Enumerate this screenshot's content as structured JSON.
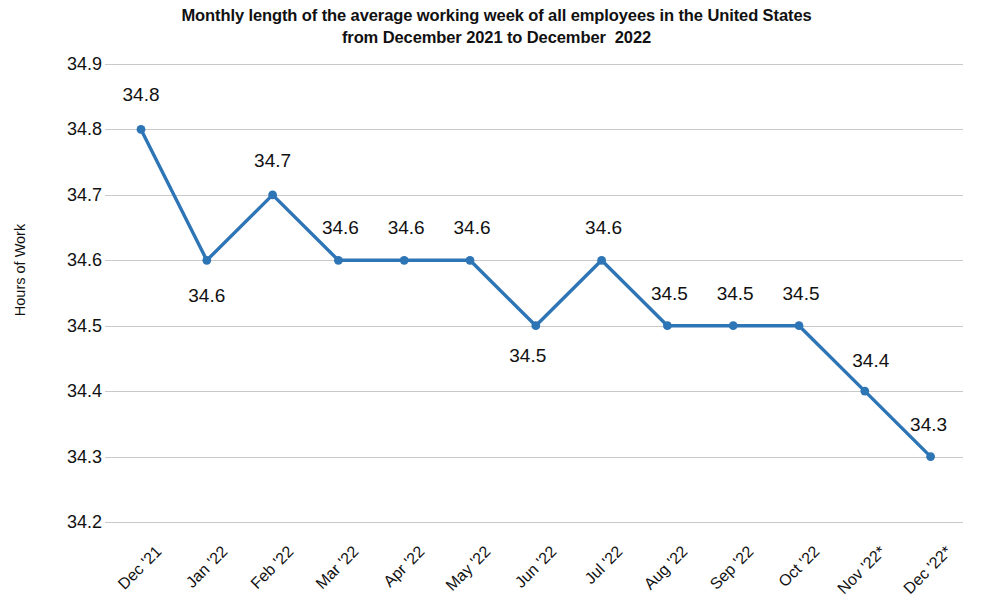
{
  "chart_data": {
    "type": "line",
    "title": "Monthly length of the average working week of all employees in the United States from December 2021 to December  2022",
    "title_lines": [
      "Monthly length of the average working week of all employees in the United States",
      "from December 2021 to December  2022"
    ],
    "xlabel": "",
    "ylabel": "Hours of Work",
    "categories": [
      "Dec '21",
      "Jan '22",
      "Feb '22",
      "Mar '22",
      "Apr '22",
      "May '22",
      "Jun '22",
      "Jul '22",
      "Aug '22",
      "Sep '22",
      "Oct '22",
      "Nov '22*",
      "Dec '22*"
    ],
    "values": [
      34.8,
      34.6,
      34.7,
      34.6,
      34.6,
      34.6,
      34.5,
      34.6,
      34.5,
      34.5,
      34.5,
      34.4,
      34.3
    ],
    "data_labels": [
      "34.8",
      "34.6",
      "34.7",
      "34.6",
      "34.6",
      "34.6",
      "34.5",
      "34.6",
      "34.5",
      "34.5",
      "34.5",
      "34.4",
      "34.3"
    ],
    "data_label_positions": [
      "above",
      "below",
      "above",
      "above",
      "above",
      "above",
      "below",
      "above",
      "above",
      "above",
      "above",
      "above",
      "above"
    ],
    "ylim": [
      34.2,
      34.9
    ],
    "ytick_labels": [
      "34.9",
      "34.8",
      "34.7",
      "34.6",
      "34.5",
      "34.4",
      "34.3",
      "34.2"
    ],
    "ytick_values": [
      34.9,
      34.8,
      34.7,
      34.6,
      34.5,
      34.4,
      34.3,
      34.2
    ],
    "grid": true,
    "legend": "none",
    "series_color": "#2E75B6",
    "grid_color": "#C9C9C9",
    "marker": "circle",
    "footnote_marker": "*"
  }
}
